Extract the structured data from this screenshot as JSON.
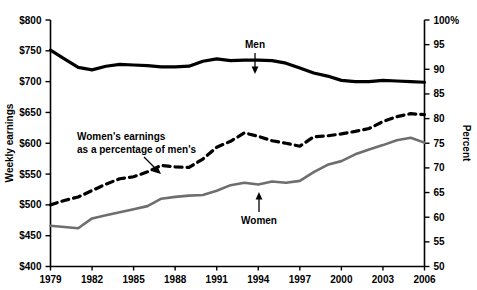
{
  "chart_data": {
    "type": "line",
    "title": "",
    "subtitle": "",
    "xlabel": "",
    "ylabel": "Weekly earnings",
    "y2label": "Percent",
    "x": [
      1979,
      1980,
      1981,
      1982,
      1983,
      1984,
      1985,
      1986,
      1987,
      1988,
      1989,
      1990,
      1991,
      1992,
      1993,
      1994,
      1995,
      1996,
      1997,
      1998,
      1999,
      2000,
      2001,
      2002,
      2003,
      2004,
      2005,
      2006
    ],
    "xlim": [
      1979,
      2006
    ],
    "ylim": [
      400,
      800
    ],
    "y2lim": [
      50,
      100
    ],
    "grid": false,
    "legend_position": "inline-annotations",
    "xtick_labels": [
      "1979",
      "1982",
      "1985",
      "1988",
      "1991",
      "1994",
      "1997",
      "2000",
      "2003",
      "2006"
    ],
    "xtick_values": [
      1979,
      1982,
      1985,
      1988,
      1991,
      1994,
      1997,
      2000,
      2003,
      2006
    ],
    "ytick_labels": [
      "$400",
      "$450",
      "$500",
      "$550",
      "$600",
      "$650",
      "$700",
      "$750",
      "$800"
    ],
    "ytick_values": [
      400,
      450,
      500,
      550,
      600,
      650,
      700,
      750,
      800
    ],
    "y2tick_labels": [
      "50",
      "55",
      "60",
      "65",
      "70",
      "75",
      "80",
      "85",
      "90",
      "95",
      "100%"
    ],
    "y2tick_values": [
      50,
      55,
      60,
      65,
      70,
      75,
      80,
      85,
      90,
      95,
      100
    ],
    "series": [
      {
        "name": "Men",
        "axis": "left",
        "style": "solid-black",
        "color": "#000000",
        "values": [
          751,
          737,
          723,
          719,
          725,
          728,
          727,
          726,
          724,
          724,
          725,
          733,
          737,
          734,
          735,
          735,
          734,
          730,
          722,
          714,
          709,
          702,
          700,
          700,
          702,
          701,
          700,
          699
        ]
      },
      {
        "name": "Women",
        "axis": "left",
        "style": "solid-gray",
        "color": "#6e6e6e",
        "values": [
          466,
          464,
          462,
          478,
          483,
          488,
          493,
          498,
          510,
          513,
          515,
          516,
          523,
          532,
          536,
          533,
          538,
          536,
          539,
          553,
          565,
          571,
          582,
          590,
          597,
          605,
          609,
          601
        ]
      },
      {
        "name": "Women's earnings as a percentage of men's",
        "axis": "right",
        "style": "dashed-black",
        "color": "#000000",
        "values": [
          62.5,
          63.4,
          64.1,
          65.4,
          66.7,
          67.8,
          68.2,
          69.2,
          70.5,
          70.2,
          70.1,
          71.8,
          74.2,
          75.4,
          77.1,
          76.4,
          75.5,
          75.0,
          74.4,
          76.3,
          76.5,
          76.9,
          77.4,
          78.0,
          79.4,
          80.4,
          81.0,
          80.8
        ]
      }
    ],
    "annotations": [
      {
        "text": "Men",
        "series": "Men"
      },
      {
        "text": "Women",
        "series": "Women"
      },
      {
        "text": "Women's earnings",
        "series": "percentage",
        "line": 1
      },
      {
        "text": "as a percentage of men's",
        "series": "percentage",
        "line": 2
      }
    ]
  }
}
